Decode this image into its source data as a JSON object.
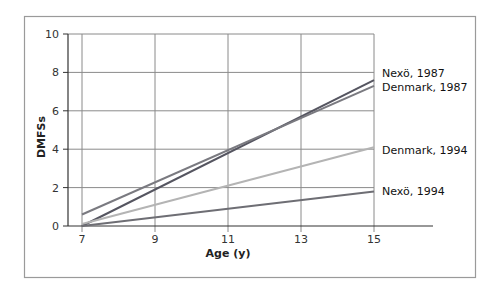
{
  "chart_data": {
    "type": "line",
    "title": "",
    "xlabel": "Age (y)",
    "ylabel": "DMFSs",
    "xlim": [
      7,
      15
    ],
    "ylim": [
      0,
      10
    ],
    "x_ticks": [
      7,
      9,
      11,
      13,
      15
    ],
    "y_ticks": [
      0,
      2,
      4,
      6,
      8,
      10
    ],
    "grid": true,
    "legend_position": "direct labels at right end of lines",
    "series": [
      {
        "name": "Nexö, 1987",
        "x": [
          7,
          15
        ],
        "values": [
          0.0,
          7.6
        ],
        "color": "#555560"
      },
      {
        "name": "Denmark, 1987",
        "x": [
          7,
          15
        ],
        "values": [
          0.6,
          7.3
        ],
        "color": "#7a7a80"
      },
      {
        "name": "Denmark, 1994",
        "x": [
          7,
          15
        ],
        "values": [
          0.1,
          4.1
        ],
        "color": "#b4b4b4"
      },
      {
        "name": "Nexö, 1994",
        "x": [
          7,
          15
        ],
        "values": [
          0.0,
          1.8
        ],
        "color": "#6e6e74"
      }
    ]
  },
  "labels": {
    "y_axis_title": "DMFSs",
    "x_axis_title": "Age (y)",
    "y_ticks": [
      "0",
      "2",
      "4",
      "6",
      "8",
      "10"
    ],
    "x_ticks": [
      "7",
      "9",
      "11",
      "13",
      "15"
    ],
    "series": [
      "Nexö, 1987",
      "Denmark, 1987",
      "Denmark, 1994",
      "Nexö, 1994"
    ]
  }
}
